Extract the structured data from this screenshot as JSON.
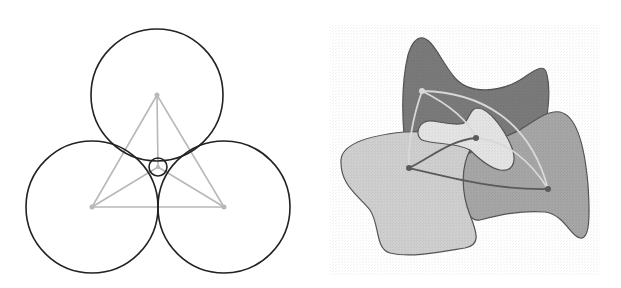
{
  "figure": {
    "width": 621,
    "height": 288,
    "background": "#ffffff"
  },
  "left_panel": {
    "description": "Three mutually tangent circles with inner tangent circle and triangle of centers",
    "outline_color": "#222222",
    "construction_color": "#b8b8b8",
    "circles": [
      {
        "name": "top",
        "cx": 157,
        "cy": 95,
        "r": 66
      },
      {
        "name": "bottom-left",
        "cx": 92,
        "cy": 207,
        "r": 66
      },
      {
        "name": "bottom-right",
        "cx": 224,
        "cy": 207,
        "r": 66
      },
      {
        "name": "inner",
        "cx": 158,
        "cy": 167,
        "r": 9
      }
    ],
    "center_points": [
      {
        "x": 157,
        "y": 95
      },
      {
        "x": 92,
        "y": 207
      },
      {
        "x": 224,
        "y": 207
      },
      {
        "x": 158,
        "y": 167
      }
    ]
  },
  "right_panel": {
    "description": "Overlapping irregular shaded regions connected by curved arcs between marked points",
    "colors": {
      "dark": "#7a7a7a",
      "medium": "#a6a6a6",
      "light": "#cfcfcf",
      "lightest": "#e4e4e4",
      "outline": "#555555",
      "arc_light": "#d8d8d8",
      "arc_dark": "#5a5a5a"
    },
    "points": [
      {
        "x": 422,
        "y": 91
      },
      {
        "x": 476,
        "y": 138
      },
      {
        "x": 409,
        "y": 168
      },
      {
        "x": 548,
        "y": 189
      }
    ]
  }
}
